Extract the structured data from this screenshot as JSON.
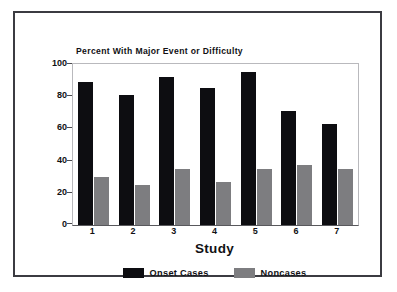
{
  "chart_data": {
    "type": "bar",
    "title": "Percent With Major Event or Difficulty",
    "xlabel": "Study",
    "ylabel": "",
    "categories": [
      "1",
      "2",
      "3",
      "4",
      "5",
      "6",
      "7"
    ],
    "series": [
      {
        "name": "Onset Cases",
        "color": "#0d0d11",
        "values": [
          89,
          81,
          92,
          85,
          95,
          71,
          63
        ]
      },
      {
        "name": "Noncases",
        "color": "#7d7d80",
        "values": [
          30,
          25,
          35,
          27,
          35,
          37,
          35
        ]
      }
    ],
    "ylim": [
      0,
      100
    ],
    "yticks": [
      0,
      20,
      40,
      60,
      80,
      100
    ],
    "ytick_labels": [
      "0",
      "20",
      "40",
      "60",
      "80",
      "100"
    ],
    "grid": false,
    "legend_position": "bottom-center"
  },
  "legend": {
    "entries": [
      {
        "label": "Onset Cases",
        "swatch": "black-swatch-icon"
      },
      {
        "label": "Noncases",
        "swatch": "gray-swatch-icon"
      }
    ]
  },
  "colors": {
    "onset": "#0d0d11",
    "noncase": "#7d7d80",
    "frame": "#3b3b41",
    "axis": "#58585c",
    "background": "#ffffff"
  }
}
